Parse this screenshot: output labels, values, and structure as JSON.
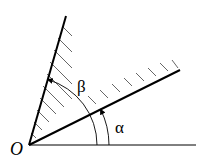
{
  "diagram": {
    "type": "angle-wedge",
    "origin_label": "O",
    "alpha_label": "α",
    "beta_label": "β",
    "colors": {
      "line": "#000000",
      "hatch": "#555555",
      "background": "#ffffff"
    }
  }
}
